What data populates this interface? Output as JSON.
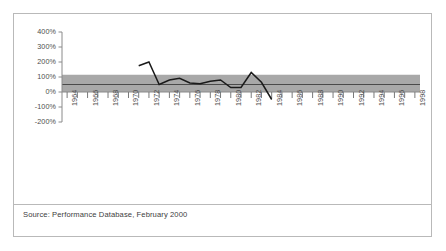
{
  "figure": {
    "source_note": "Source: Performance Database, February 2000",
    "frame_color": "#b9b9b9",
    "background_color": "#ffffff"
  },
  "chart_data": {
    "type": "line",
    "title": "",
    "subtitle": "",
    "xlabel": "",
    "ylabel": "",
    "grid": false,
    "legend": "none",
    "line_color": "#1a1a1a",
    "band_color": "#a8a8a8",
    "band_line_color": "#4a4a4a",
    "ylim": [
      -200,
      400
    ],
    "ytick_values": [
      400,
      300,
      200,
      100,
      0,
      -100,
      -200
    ],
    "ytick_labels": [
      "400%",
      "300%",
      "200%",
      "100%",
      "0%",
      "-100%",
      "-200%"
    ],
    "xlim": [
      1963.5,
      1998.5
    ],
    "xtick_values": [
      1964,
      1966,
      1968,
      1970,
      1972,
      1974,
      1976,
      1978,
      1980,
      1982,
      1984,
      1986,
      1988,
      1990,
      1992,
      1994,
      1996,
      1998
    ],
    "xtick_labels": [
      "1964",
      "1966",
      "1968",
      "1970",
      "1972",
      "1974",
      "1976",
      "1978",
      "1980",
      "1982",
      "1984",
      "1986",
      "1988",
      "1990",
      "1992",
      "1994",
      "1996",
      "1998"
    ],
    "minor_tick_years": [
      1964,
      1965,
      1966,
      1967,
      1968,
      1969,
      1970,
      1971,
      1972,
      1973,
      1974,
      1975,
      1976,
      1977,
      1978,
      1979,
      1980,
      1981,
      1982,
      1983,
      1984,
      1985,
      1986,
      1987,
      1988,
      1989,
      1990,
      1991,
      1992,
      1993,
      1994,
      1995,
      1996,
      1997,
      1998
    ],
    "reference_band": {
      "label": "",
      "lower": 0,
      "upper": 115,
      "center_line": 50
    },
    "series": [
      {
        "name": "",
        "x": [
          1971,
          1972,
          1973,
          1974,
          1975,
          1976,
          1977,
          1978,
          1979,
          1980,
          1981,
          1982,
          1983,
          1984
        ],
        "values": [
          175,
          200,
          50,
          80,
          92,
          60,
          55,
          72,
          80,
          30,
          30,
          130,
          65,
          -50
        ]
      }
    ]
  }
}
